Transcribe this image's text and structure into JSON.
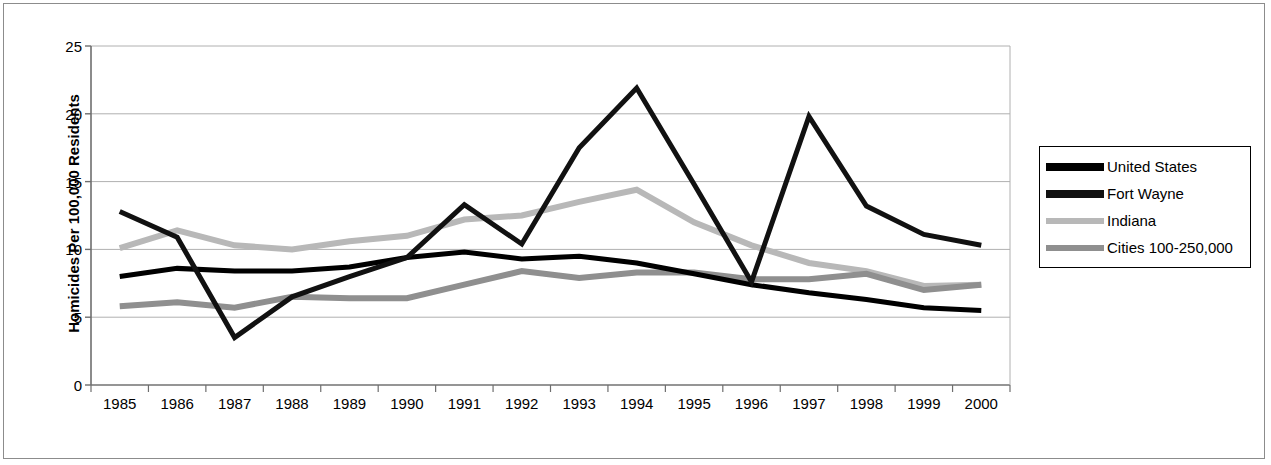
{
  "chart_data": {
    "type": "line",
    "title": "",
    "xlabel": "",
    "ylabel": "Homicides Per 100,000 Residents",
    "categories": [
      "1985",
      "1986",
      "1987",
      "1988",
      "1989",
      "1990",
      "1991",
      "1992",
      "1993",
      "1994",
      "1995",
      "1996",
      "1997",
      "1998",
      "1999",
      "2000"
    ],
    "ylim": [
      0,
      25
    ],
    "yticks": [
      0,
      5,
      10,
      15,
      20,
      25
    ],
    "ytick_labels": [
      "0",
      "5",
      "10",
      "15",
      "20",
      "25"
    ],
    "grid": "horizontal",
    "legend_position": "right",
    "series": [
      {
        "name": "United States",
        "color": "#000000",
        "width": 5,
        "values": [
          8.0,
          8.6,
          8.4,
          8.4,
          8.7,
          9.4,
          9.8,
          9.3,
          9.5,
          9.0,
          8.2,
          7.4,
          6.8,
          6.3,
          5.7,
          5.5
        ]
      },
      {
        "name": "Fort Wayne",
        "color": "#111111",
        "width": 5,
        "values": [
          12.8,
          10.9,
          3.5,
          6.5,
          8.0,
          9.4,
          13.3,
          10.4,
          17.5,
          21.9,
          14.8,
          7.6,
          19.8,
          13.2,
          11.1,
          10.3
        ]
      },
      {
        "name": "Indiana",
        "color": "#b8b8b8",
        "width": 6,
        "values": [
          10.1,
          11.4,
          10.3,
          10.0,
          10.6,
          11.0,
          12.2,
          12.5,
          13.5,
          14.4,
          12.0,
          10.3,
          9.0,
          8.4,
          7.3,
          7.4
        ]
      },
      {
        "name": "Cities 100-250,000",
        "color": "#8f8f8f",
        "width": 6,
        "values": [
          5.8,
          6.1,
          5.7,
          6.5,
          6.4,
          6.4,
          7.4,
          8.4,
          7.9,
          8.3,
          8.3,
          7.8,
          7.8,
          8.2,
          7.0,
          7.4
        ]
      }
    ]
  },
  "legend": {
    "items": [
      {
        "label": "United States"
      },
      {
        "label": "Fort Wayne"
      },
      {
        "label": "Indiana"
      },
      {
        "label": "Cities 100-250,000"
      }
    ]
  },
  "axes": {
    "y_title": "Homicides Per 100,000 Residents"
  }
}
